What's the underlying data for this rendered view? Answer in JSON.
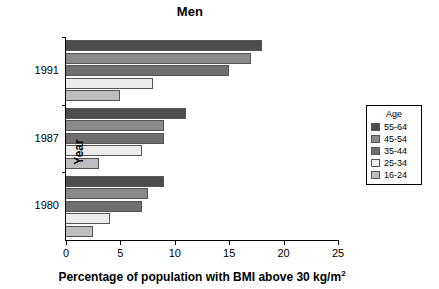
{
  "chart_data": {
    "type": "bar",
    "orientation": "horizontal",
    "title": "Men",
    "xlabel": "Percentage of population with BMI above 30 kg/m",
    "xlabel_superscript": "2",
    "ylabel": "Year",
    "categories": [
      "1991",
      "1987",
      "1980"
    ],
    "xlim": [
      0,
      25
    ],
    "xticks": [
      0,
      5,
      10,
      15,
      20,
      25
    ],
    "xtick_labels": [
      "0",
      "5",
      "10",
      "15",
      "20",
      "25"
    ],
    "grid": false,
    "legend_title": "Age",
    "legend_position": "right",
    "series": [
      {
        "name": "55-64",
        "color": "#4d4d4d",
        "values": [
          18,
          11,
          9
        ]
      },
      {
        "name": "45-54",
        "color": "#8a8a8a",
        "values": [
          17,
          9,
          7.5
        ]
      },
      {
        "name": "35-44",
        "color": "#6e6e6e",
        "values": [
          15,
          9,
          7
        ]
      },
      {
        "name": "25-34",
        "color": "#ececec",
        "values": [
          8,
          7,
          4
        ]
      },
      {
        "name": "16-24",
        "color": "#bdbdbd",
        "values": [
          5,
          3,
          2.5
        ]
      }
    ]
  }
}
